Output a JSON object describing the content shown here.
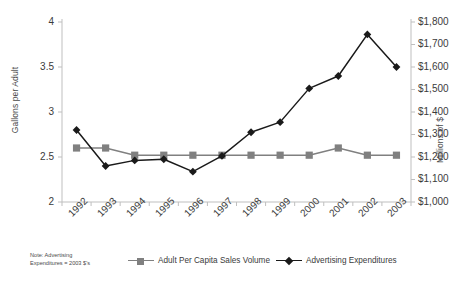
{
  "chart_data": {
    "type": "line",
    "title": "",
    "xlabel": "",
    "categories": [
      "1992",
      "1993",
      "1994",
      "1995",
      "1996",
      "1997",
      "1998",
      "1999",
      "2000",
      "2001",
      "2002",
      "2003"
    ],
    "series": [
      {
        "name": "Adult Per Capita Sales Volume",
        "axis": "left",
        "marker": "square",
        "color": "#808080",
        "values": [
          2.6,
          2.6,
          2.52,
          2.52,
          2.52,
          2.52,
          2.52,
          2.52,
          2.52,
          2.6,
          2.52,
          2.52
        ]
      },
      {
        "name": "Advertising Expenditures",
        "axis": "right",
        "marker": "diamond",
        "color": "#1a1a1a",
        "values": [
          1320,
          1160,
          1185,
          1190,
          1135,
          1205,
          1310,
          1355,
          1505,
          1560,
          1745,
          1600
        ]
      }
    ],
    "left_axis": {
      "label": "Gallons per Adult",
      "ticks": [
        "2",
        "2.5",
        "3",
        "3.5",
        "4"
      ],
      "tick_values": [
        2,
        2.5,
        3,
        3.5,
        4
      ],
      "ylim": [
        2,
        4
      ]
    },
    "right_axis": {
      "label": "Millions of $",
      "ticks": [
        "$1,000",
        "$1,100",
        "$1,200",
        "$1,300",
        "$1,400",
        "$1,500",
        "$1,600",
        "$1,700",
        "$1,800"
      ],
      "tick_values": [
        1000,
        1100,
        1200,
        1300,
        1400,
        1500,
        1600,
        1700,
        1800
      ],
      "ylim": [
        1000,
        1800
      ]
    },
    "grid": false,
    "legend_position": "bottom"
  },
  "note": {
    "line1": "Note:  Advertising",
    "line2": "Expenditures = 2003 $'s"
  },
  "legend": {
    "items": [
      {
        "label": "Adult Per Capita Sales Volume",
        "color": "#808080",
        "marker": "square"
      },
      {
        "label": "Advertising Expenditures",
        "color": "#1a1a1a",
        "marker": "diamond"
      }
    ]
  },
  "colors": {
    "sales_series": "#808080",
    "advertising_series": "#1a1a1a",
    "axis": "#bfbfbf",
    "text": "#3b3b3b",
    "background": "#ffffff"
  }
}
